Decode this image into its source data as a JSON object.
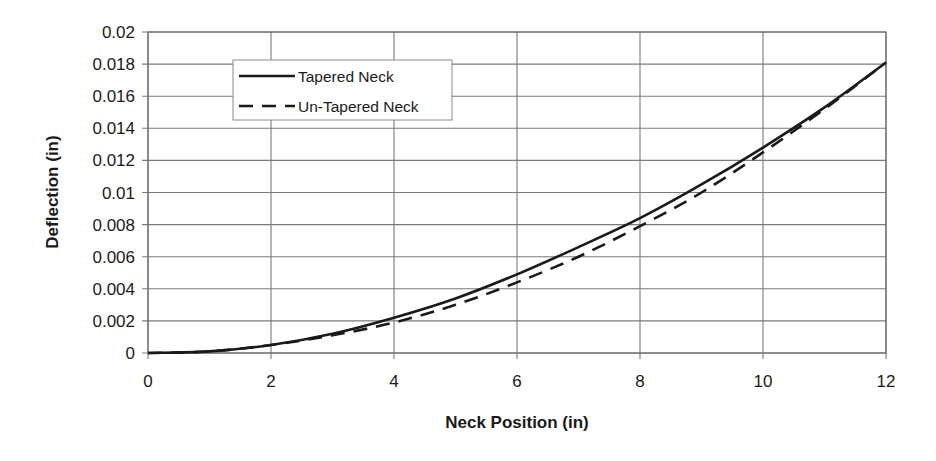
{
  "chart_data": {
    "type": "line",
    "title": "",
    "xlabel": "Neck Position (in)",
    "ylabel": "Deflection (in)",
    "xlim": [
      0,
      12
    ],
    "ylim": [
      0,
      0.02
    ],
    "x_ticks": [
      "0",
      "2",
      "4",
      "6",
      "8",
      "10",
      "12"
    ],
    "y_ticks": [
      "0",
      "0.002",
      "0.004",
      "0.006",
      "0.008",
      "0.01",
      "0.012",
      "0.014",
      "0.016",
      "0.018",
      "0.02"
    ],
    "grid": true,
    "legend_position": "upper-left (inside plot)",
    "x": [
      0,
      1,
      2,
      3,
      4,
      5,
      6,
      7,
      8,
      9,
      10,
      11,
      12
    ],
    "series": [
      {
        "name": "Tapered Neck",
        "style": "solid",
        "color": "#1a1a1a",
        "values": [
          0,
          0.0001,
          0.0005,
          0.0012,
          0.0022,
          0.0034,
          0.0049,
          0.0066,
          0.0084,
          0.0105,
          0.0128,
          0.0153,
          0.0181
        ]
      },
      {
        "name": "Un-Tapered Neck",
        "style": "dashed",
        "color": "#1a1a1a",
        "values": [
          0,
          0.0001,
          0.0005,
          0.0011,
          0.0019,
          0.003,
          0.0044,
          0.006,
          0.0079,
          0.01,
          0.0125,
          0.0152,
          0.0181
        ]
      }
    ]
  },
  "legend": {
    "items": [
      "Tapered Neck",
      "Un-Tapered Neck"
    ]
  },
  "colors": {
    "line": "#1a1a1a",
    "grid": "#7a7a7a",
    "background": "#ffffff"
  }
}
